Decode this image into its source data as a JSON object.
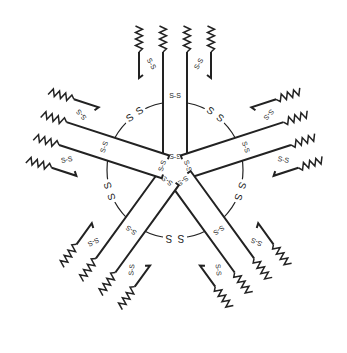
{
  "diagram": {
    "center": [
      175,
      170
    ],
    "ring_radius": 68,
    "arm_count": 5,
    "stroke_color": "#222222",
    "background": "#ffffff",
    "labels": {
      "disulfide": "S-S",
      "ring_sulfur": "S"
    },
    "arms": [
      {
        "angle": 0
      },
      {
        "angle": 72
      },
      {
        "angle": 144
      },
      {
        "angle": 216
      },
      {
        "angle": 288
      }
    ]
  }
}
